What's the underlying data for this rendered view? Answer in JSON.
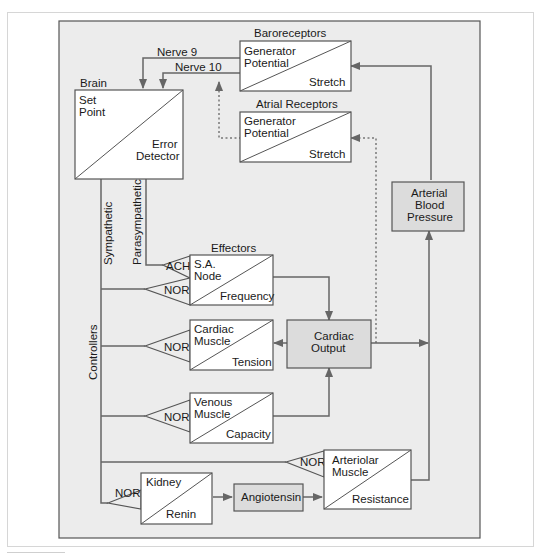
{
  "colors": {
    "panel": "#ececec",
    "box_fill": "#ffffff",
    "shaded_box_fill": "#dcdcdc",
    "line": "#666666"
  },
  "labels": {
    "baroreceptors": "Baroreceptors",
    "atrial_receptors": "Atrial Receptors",
    "brain": "Brain",
    "effectors": "Effectors",
    "nerve9": "Nerve 9",
    "nerve10": "Nerve 10",
    "sympathetic": "Sympathetic",
    "parasympathetic": "Parasympathetic",
    "controllers": "Controllers"
  },
  "blocks": {
    "baro": {
      "top": "Generator",
      "top2": "Potential",
      "bottom": "Stretch"
    },
    "atrial": {
      "top": "Generator",
      "top2": "Potential",
      "bottom": "Stretch"
    },
    "brain": {
      "top": "Set",
      "top2": "Point",
      "bottom": "Error",
      "bottom2": "Detector"
    },
    "sa_node": {
      "top": "S.A.",
      "top2": "Node",
      "bottom": "Frequency"
    },
    "cardiac_muscle": {
      "top": "Cardiac",
      "top2": "Muscle",
      "bottom": "Tension"
    },
    "venous_muscle": {
      "top": "Venous",
      "top2": "Muscle",
      "bottom": "Capacity"
    },
    "arteriolar_muscle": {
      "top": "Arteriolar",
      "top2": "Muscle",
      "bottom": "Resistance"
    },
    "kidney": {
      "top": "Kidney",
      "bottom": "Renin"
    }
  },
  "shaded": {
    "cardiac_output": {
      "line1": "Cardiac",
      "line2": "Output"
    },
    "arterial_bp": {
      "line1": "Arterial",
      "line2": "Blood",
      "line3": "Pressure"
    },
    "angiotensin": {
      "line1": "Angiotensin"
    }
  },
  "transmitters": {
    "ach": "ACH",
    "nor_sa": "NOR",
    "nor_cardiac": "NOR",
    "nor_venous": "NOR",
    "nor_arteriolar": "NOR",
    "nor_kidney": "NOR"
  }
}
